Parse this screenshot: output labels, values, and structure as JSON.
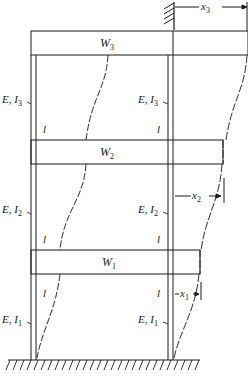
{
  "figure": {
    "type": "multi-story shear building with deflected shape",
    "stories": [
      {
        "floor": 3,
        "mass_label": "W",
        "mass_sub": "3",
        "column_label": "E, I",
        "column_sub": "3",
        "length_label": "l",
        "displacement_label": "x",
        "displacement_sub": "3"
      },
      {
        "floor": 2,
        "mass_label": "W",
        "mass_sub": "2",
        "column_label": "E, I",
        "column_sub": "2",
        "length_label": "l",
        "displacement_label": "x",
        "displacement_sub": "2"
      },
      {
        "floor": 1,
        "mass_label": "W",
        "mass_sub": "1",
        "column_label": "E, I",
        "column_sub": "1",
        "length_label": "l",
        "displacement_label": "x",
        "displacement_sub": "1"
      }
    ],
    "support": "fixed ground (hatched)",
    "reference": "fixed wall reference at top (hatched)",
    "colors": {
      "line": "#1a1a1a",
      "background": "#ffffff"
    }
  }
}
